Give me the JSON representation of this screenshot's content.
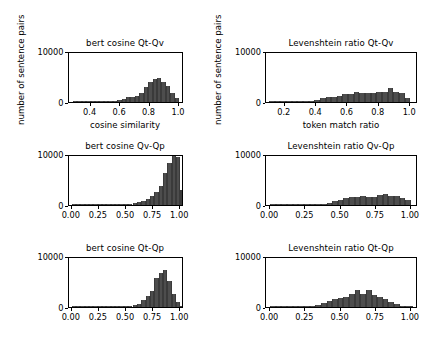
{
  "figure": {
    "background": "#ffffff",
    "bar_color": "#4d4d4d",
    "axis_color": "#000000",
    "rows": 3,
    "cols": 2
  },
  "chart_data": [
    {
      "type": "bar",
      "title": "bert cosine Qt-Qv",
      "xlabel": "cosine similarity",
      "ylabel": "number of sentence pairs",
      "xlim": [
        0.25,
        1.03
      ],
      "ylim": [
        0,
        10000
      ],
      "xticks": [
        0.4,
        0.6,
        0.8,
        1.0
      ],
      "xticklabels": [
        "0.4",
        "0.6",
        "0.8",
        "1.0"
      ],
      "yticks": [
        0,
        10000
      ],
      "yticklabels": [
        "0",
        "10000"
      ],
      "grid": false,
      "legend": null,
      "bin_edges": [
        0.28,
        0.31,
        0.34,
        0.37,
        0.4,
        0.43,
        0.46,
        0.49,
        0.52,
        0.55,
        0.58,
        0.61,
        0.64,
        0.67,
        0.7,
        0.73,
        0.76,
        0.79,
        0.82,
        0.85,
        0.88,
        0.91,
        0.94,
        0.97,
        1.0
      ],
      "values": [
        10,
        15,
        20,
        25,
        35,
        45,
        60,
        90,
        130,
        200,
        300,
        500,
        900,
        1000,
        1100,
        1700,
        2900,
        3950,
        4500,
        4700,
        3900,
        3200,
        1800,
        700
      ]
    },
    {
      "type": "bar",
      "title": "Levenshtein ratio Qt-Qv",
      "xlabel": "token match ratio",
      "ylabel": "number of sentence pairs",
      "xlim": [
        0.08,
        1.05
      ],
      "ylim": [
        0,
        10000
      ],
      "xticks": [
        0.2,
        0.4,
        0.6,
        0.8,
        1.0
      ],
      "xticklabels": [
        "0.2",
        "0.4",
        "0.6",
        "0.8",
        "1.0"
      ],
      "yticks": [
        0,
        10000
      ],
      "yticklabels": [
        "0",
        "10000"
      ],
      "grid": false,
      "legend": null,
      "bin_edges": [
        0.1,
        0.136,
        0.172,
        0.208,
        0.244,
        0.28,
        0.316,
        0.352,
        0.388,
        0.424,
        0.46,
        0.496,
        0.532,
        0.568,
        0.604,
        0.64,
        0.676,
        0.712,
        0.748,
        0.784,
        0.82,
        0.856,
        0.892,
        0.928,
        0.964,
        1.0
      ],
      "values": [
        20,
        30,
        40,
        60,
        80,
        110,
        160,
        230,
        330,
        700,
        900,
        1000,
        1200,
        1550,
        1500,
        1950,
        1700,
        1750,
        1780,
        2000,
        1900,
        2750,
        1950,
        1800,
        850
      ]
    },
    {
      "type": "bar",
      "title": "bert cosine Qv-Qp",
      "xlabel": "",
      "ylabel": "",
      "xlim": [
        -0.03,
        1.03
      ],
      "ylim": [
        0,
        10000
      ],
      "xticks": [
        0.0,
        0.25,
        0.5,
        0.75,
        1.0
      ],
      "xticklabels": [
        "0.00",
        "0.25",
        "0.50",
        "0.75",
        "1.00"
      ],
      "yticks": [
        0,
        10000
      ],
      "yticklabels": [
        "0",
        "10000"
      ],
      "grid": false,
      "legend": null,
      "bin_edges": [
        0.0,
        0.04,
        0.08,
        0.12,
        0.16,
        0.2,
        0.24,
        0.28,
        0.32,
        0.36,
        0.4,
        0.44,
        0.48,
        0.52,
        0.56,
        0.6,
        0.64,
        0.68,
        0.72,
        0.76,
        0.8,
        0.84,
        0.88,
        0.92,
        0.96,
        1.0
      ],
      "values": [
        5,
        5,
        8,
        10,
        12,
        15,
        18,
        25,
        30,
        40,
        55,
        80,
        120,
        180,
        300,
        500,
        750,
        1100,
        1700,
        2500,
        3800,
        6200,
        8200,
        10000,
        9500,
        3000
      ]
    },
    {
      "type": "bar",
      "title": "Levenshtein ratio Qv-Qp",
      "xlabel": "",
      "ylabel": "",
      "xlim": [
        -0.03,
        1.05
      ],
      "ylim": [
        0,
        10000
      ],
      "xticks": [
        0.0,
        0.25,
        0.5,
        0.75,
        1.0
      ],
      "xticklabels": [
        "0.00",
        "0.25",
        "0.50",
        "0.75",
        "1.00"
      ],
      "yticks": [
        0,
        10000
      ],
      "yticklabels": [
        "0",
        "10000"
      ],
      "grid": false,
      "legend": null,
      "bin_edges": [
        0.0,
        0.04,
        0.08,
        0.12,
        0.16,
        0.2,
        0.24,
        0.28,
        0.32,
        0.36,
        0.4,
        0.44,
        0.48,
        0.52,
        0.56,
        0.6,
        0.64,
        0.68,
        0.72,
        0.76,
        0.8,
        0.84,
        0.88,
        0.92,
        0.96,
        1.0
      ],
      "values": [
        5,
        5,
        8,
        10,
        15,
        20,
        30,
        45,
        70,
        110,
        300,
        700,
        900,
        1300,
        1500,
        1600,
        1750,
        1600,
        1500,
        2050,
        2200,
        1700,
        1800,
        1400,
        900
      ],
      "note": "last bin near 1.00 drops to baseline"
    },
    {
      "type": "bar",
      "title": "bert cosine Qt-Qp",
      "xlabel": "",
      "ylabel": "",
      "xlim": [
        -0.03,
        1.03
      ],
      "ylim": [
        0,
        10000
      ],
      "xticks": [
        0.0,
        0.25,
        0.5,
        0.75,
        1.0
      ],
      "xticklabels": [
        "0.00",
        "0.25",
        "0.50",
        "0.75",
        "1.00"
      ],
      "yticks": [
        0,
        10000
      ],
      "yticklabels": [
        "0",
        "10000"
      ],
      "grid": false,
      "legend": null,
      "bin_edges": [
        0.0,
        0.04,
        0.08,
        0.12,
        0.16,
        0.2,
        0.24,
        0.28,
        0.32,
        0.36,
        0.4,
        0.44,
        0.48,
        0.52,
        0.56,
        0.6,
        0.64,
        0.68,
        0.72,
        0.76,
        0.8,
        0.84,
        0.88,
        0.92,
        0.96,
        1.0
      ],
      "values": [
        5,
        5,
        8,
        10,
        12,
        15,
        20,
        25,
        35,
        50,
        70,
        100,
        150,
        220,
        320,
        500,
        1300,
        2100,
        3100,
        5600,
        6600,
        7200,
        5100,
        2600,
        900,
        150
      ]
    },
    {
      "type": "bar",
      "title": "Levenshtein ratio Qt-Qp",
      "xlabel": "",
      "ylabel": "",
      "xlim": [
        -0.03,
        1.05
      ],
      "ylim": [
        0,
        10000
      ],
      "xticks": [
        0.0,
        0.25,
        0.5,
        0.75,
        1.0
      ],
      "xticklabels": [
        "0.00",
        "0.25",
        "0.50",
        "0.75",
        "1.00"
      ],
      "yticks": [
        0,
        10000
      ],
      "yticklabels": [
        "0",
        "10000"
      ],
      "grid": false,
      "legend": null,
      "bin_edges": [
        0.0,
        0.04,
        0.08,
        0.12,
        0.16,
        0.2,
        0.24,
        0.28,
        0.32,
        0.36,
        0.4,
        0.44,
        0.48,
        0.52,
        0.56,
        0.6,
        0.64,
        0.68,
        0.72,
        0.76,
        0.8,
        0.84,
        0.88,
        0.92,
        0.96,
        1.0
      ],
      "values": [
        5,
        8,
        10,
        15,
        20,
        35,
        60,
        110,
        300,
        700,
        1100,
        1600,
        1800,
        2000,
        2600,
        3400,
        2500,
        3400,
        2400,
        2000,
        1500,
        1000,
        600,
        220,
        60,
        10
      ]
    }
  ]
}
